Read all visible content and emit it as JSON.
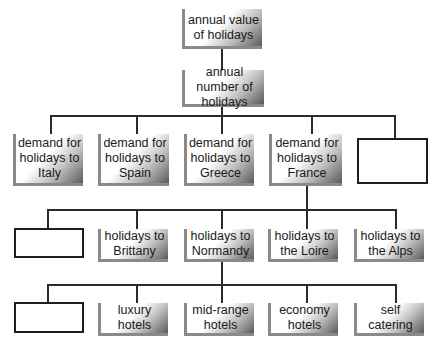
{
  "diagram": {
    "type": "hierarchy tree",
    "level1": {
      "label": "annual value of holidays"
    },
    "level2": {
      "label": "annual number of holidays"
    },
    "level3": [
      {
        "label": "demand for holidays to Italy"
      },
      {
        "label": "demand for holidays to Spain"
      },
      {
        "label": "demand for holidays to Greece"
      },
      {
        "label": "demand for holidays to France"
      },
      {
        "label": ""
      }
    ],
    "level4": [
      {
        "label": ""
      },
      {
        "label": "holidays to Brittany"
      },
      {
        "label": "holidays to Normandy"
      },
      {
        "label": "holidays to the Loire"
      },
      {
        "label": "holidays to the Alps"
      }
    ],
    "level5": [
      {
        "label": ""
      },
      {
        "label": "luxury hotels"
      },
      {
        "label": "mid-range hotels"
      },
      {
        "label": "economy hotels"
      },
      {
        "label": "self catering"
      }
    ]
  }
}
